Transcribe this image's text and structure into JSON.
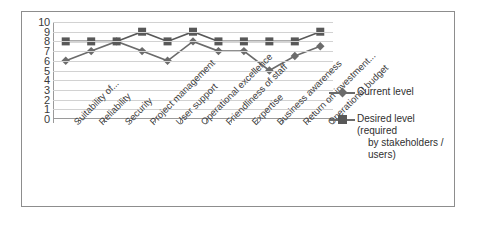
{
  "chart_data": {
    "type": "line",
    "title": "",
    "xlabel": "",
    "ylabel": "",
    "ylim": [
      0,
      10
    ],
    "ytick_step": 1,
    "grid": true,
    "legend_position": "right",
    "categories": [
      "Suitability of...",
      "Reliability",
      "Security",
      "Project management",
      "User support",
      "Operational excellence",
      "Friendliness of staff",
      "Expertise",
      "Business awareness",
      "Return on investment...",
      "Operational budget"
    ],
    "ytick_labels": [
      "10",
      "9",
      "8",
      "7",
      "6",
      "5",
      "4",
      "3",
      "2",
      "1",
      "0"
    ],
    "series": [
      {
        "name": "Current level",
        "marker": "diamond",
        "color": "#6b6b6b",
        "values": [
          6,
          7,
          8,
          7,
          6,
          8,
          7,
          7,
          5,
          6.5,
          7.5
        ]
      },
      {
        "name": "Desired level (required by stakeholders / users)",
        "marker": "square",
        "color": "#585858",
        "values": [
          8,
          8,
          8,
          9,
          8,
          9,
          8,
          8,
          8,
          8,
          9
        ]
      }
    ]
  },
  "legend": {
    "entries": [
      {
        "label": "Current level",
        "label_line2": ""
      },
      {
        "label": "Desired level (required",
        "label_line2": "by stakeholders / users)"
      }
    ]
  },
  "colors": {
    "current_level": "#6b6b6b",
    "desired_level": "#585858",
    "gridline": "#d2d2d2",
    "axis": "#9a9a9a",
    "frame_border": "#8d8d8d",
    "background": "#ffffff",
    "text": "#3b3b3b"
  }
}
